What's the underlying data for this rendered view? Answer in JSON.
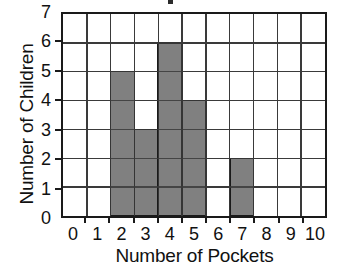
{
  "chart_data": {
    "type": "bar",
    "title": "",
    "xlabel": "Number of Pockets",
    "ylabel": "Number of Children",
    "categories": [
      "0",
      "1",
      "2",
      "3",
      "4",
      "5",
      "6",
      "7",
      "8",
      "9",
      "10"
    ],
    "values": [
      0,
      0,
      5,
      3,
      6,
      4,
      0,
      2,
      0,
      0,
      0
    ],
    "x_tick_labels": [
      "0",
      "1",
      "2",
      "3",
      "4",
      "5",
      "6",
      "7",
      "8",
      "9",
      "10"
    ],
    "y_tick_labels": [
      "0",
      "1",
      "2",
      "3",
      "4",
      "5",
      "6",
      "7"
    ],
    "xlim": [
      -0.5,
      10.5
    ],
    "ylim": [
      0,
      7
    ],
    "grid": true,
    "legend": null,
    "bar_color": "#808080",
    "bar_edge_color": "#1a1a1a",
    "grid_color": "#3a3a3a",
    "axis_color": "#1a1a1a",
    "background_color": "#ffffff",
    "bar_width": 1.0,
    "annotations": []
  },
  "axes": {
    "x_title": "Number of Pockets",
    "y_title": "Number of Children"
  }
}
